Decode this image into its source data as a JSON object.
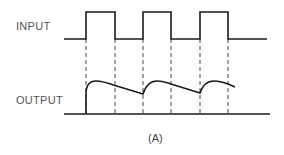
{
  "figure": {
    "caption": "(A)",
    "stroke_color": "#1a1a1a",
    "label_color": "#555555"
  },
  "input_signal": {
    "label": "INPUT",
    "type": "square-wave",
    "baseline_y": 39,
    "high_y": 12,
    "x_start": 64,
    "x_end": 267,
    "pulses": [
      {
        "rise_x": 86,
        "fall_x": 115
      },
      {
        "rise_x": 143,
        "fall_x": 171
      },
      {
        "rise_x": 200,
        "fall_x": 228
      }
    ]
  },
  "output_signal": {
    "label": "OUTPUT",
    "type": "charge-discharge",
    "baseline_y": 114,
    "x_start": 64,
    "x_end": 270,
    "end_point": {
      "x": 235,
      "y": 87
    }
  },
  "guides": {
    "style": "dashed",
    "x_positions": [
      86,
      115,
      143,
      171,
      200,
      228
    ],
    "y_top": 39,
    "y_bottom": 114
  }
}
